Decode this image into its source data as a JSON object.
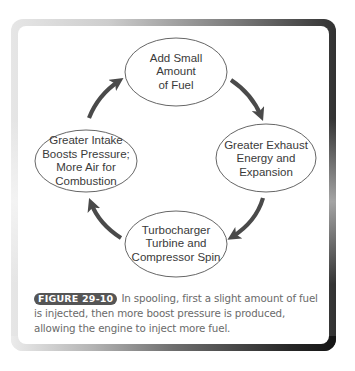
{
  "diagram": {
    "type": "cycle",
    "nodes": [
      {
        "id": "top",
        "lines": [
          "Add Small",
          "Amount",
          "of Fuel"
        ]
      },
      {
        "id": "right",
        "lines": [
          "Greater Exhaust",
          "Energy and",
          "Expansion"
        ]
      },
      {
        "id": "bottom",
        "lines": [
          "Turbocharger",
          "Turbine and",
          "Compressor Spin"
        ]
      },
      {
        "id": "left",
        "lines": [
          "Greater Intake",
          "Boosts Pressure;",
          "More Air for",
          "Combustion"
        ]
      }
    ],
    "edges": [
      {
        "from": "top",
        "to": "right"
      },
      {
        "from": "right",
        "to": "bottom"
      },
      {
        "from": "bottom",
        "to": "left"
      },
      {
        "from": "left",
        "to": "top"
      }
    ],
    "colors": {
      "arrow": "#4a4a4a",
      "ellipse_stroke": "#555555",
      "text": "#3a3a3a"
    }
  },
  "caption": {
    "label": "FIGURE 29-10",
    "text": "In spooling, first a slight amount of fuel is injected, then more boost pressure is produced, allowing the engine to inject more fuel."
  }
}
